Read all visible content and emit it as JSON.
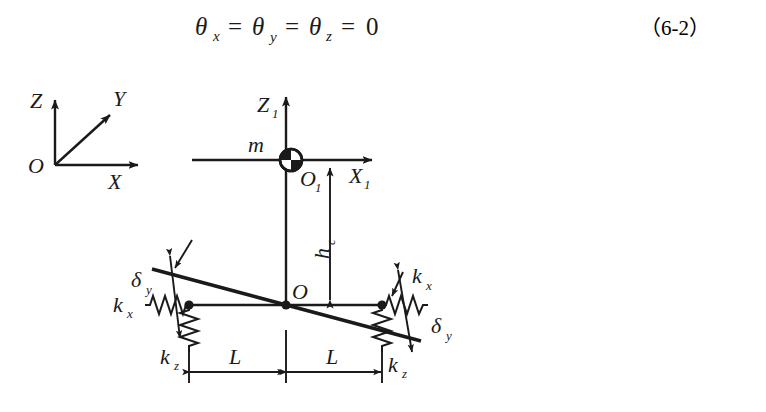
{
  "equation": {
    "text": "θx = θy = θz = 0",
    "theta": "θ",
    "sub_x": "x",
    "sub_y": "y",
    "sub_z": "z",
    "eq1": "=",
    "eq2": "=",
    "eq3": "=",
    "zero": "0",
    "number": "（6-2）"
  },
  "global_frame": {
    "origin": "O",
    "axis_z": "Z",
    "axis_y": "Y",
    "axis_x": "X"
  },
  "body_frame": {
    "origin": "O",
    "origin_sub": "1",
    "axis_z": "Z",
    "axis_z_sub": "1",
    "axis_x": "X",
    "axis_x_sub": "1",
    "mass": "m"
  },
  "dimensions": {
    "height_label": "h",
    "height_sub": "c",
    "length_left": "L",
    "length_right": "L",
    "platform_origin": "O"
  },
  "springs": {
    "left_horizontal": "k",
    "left_horizontal_sub": "x",
    "left_vertical": "k",
    "left_vertical_sub": "z",
    "right_horizontal": "k",
    "right_horizontal_sub": "x",
    "right_vertical": "k",
    "right_vertical_sub": "z"
  },
  "deflection": {
    "left_label": "δ",
    "left_sub": "y",
    "right_label": "δ",
    "right_sub": "y"
  },
  "colors": {
    "ink": "#1a1a1a",
    "background": "#ffffff"
  }
}
